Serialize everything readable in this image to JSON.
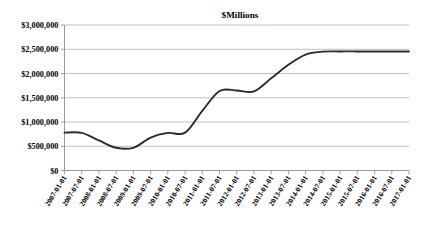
{
  "chart_data": {
    "type": "line",
    "title": "$Millions",
    "xlabel": "",
    "ylabel": "",
    "ylim": [
      0,
      3000000
    ],
    "ytick_values": [
      0,
      500000,
      1000000,
      1500000,
      2000000,
      2500000,
      3000000
    ],
    "ytick_labels": [
      "$0",
      "$500,000",
      "$1,000,000",
      "$1,500,000",
      "$2,000,000",
      "$2,500,000",
      "$3,000,000"
    ],
    "grid": true,
    "legend": false,
    "legend_position": "none",
    "line_color": "#2b2b2b",
    "categories": [
      "2007-01-01",
      "2007-07-01",
      "2008-01-01",
      "2008-07-01",
      "2009-01-01",
      "2009-07-01",
      "2010-01-01",
      "2010-07-01",
      "2011-01-01",
      "2011-07-01",
      "2012-01-01",
      "2012-07-01",
      "2013-01-01",
      "2013-07-01",
      "2014-01-01",
      "2014-07-01",
      "2015-01-01",
      "2015-07-01",
      "2016-01-01",
      "2016-07-01",
      "2017-01-01"
    ],
    "values": [
      780000,
      775000,
      620000,
      470000,
      468000,
      680000,
      775000,
      780000,
      1230000,
      1640000,
      1650000,
      1630000,
      1900000,
      2180000,
      2390000,
      2450000,
      2455000,
      2455000,
      2455000,
      2455000,
      2455000
    ],
    "series": [
      {
        "name": "$Millions",
        "values": [
          780000,
          775000,
          620000,
          470000,
          468000,
          680000,
          775000,
          780000,
          1230000,
          1640000,
          1650000,
          1630000,
          1900000,
          2180000,
          2390000,
          2450000,
          2455000,
          2455000,
          2455000,
          2455000,
          2455000
        ]
      }
    ]
  }
}
